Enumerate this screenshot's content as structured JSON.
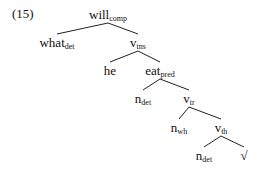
{
  "example_number": "(15)",
  "tree": {
    "nodes": [
      {
        "id": "will",
        "base": "will",
        "sub": "comp",
        "parent": null
      },
      {
        "id": "what",
        "base": "what",
        "sub": "det",
        "parent": "will"
      },
      {
        "id": "vtns",
        "base": "v",
        "sub": "tns",
        "parent": "will"
      },
      {
        "id": "he",
        "base": "he",
        "sub": "",
        "parent": "vtns"
      },
      {
        "id": "eat",
        "base": "eat",
        "sub": "pred",
        "parent": "vtns"
      },
      {
        "id": "ndet1",
        "base": "n",
        "sub": "det",
        "parent": "eat"
      },
      {
        "id": "vtr",
        "base": "v",
        "sub": "tr",
        "parent": "eat"
      },
      {
        "id": "nwh",
        "base": "n",
        "sub": "wh",
        "parent": "vtr"
      },
      {
        "id": "vth",
        "base": "v",
        "sub": "th",
        "parent": "vtr"
      },
      {
        "id": "ndet2",
        "base": "n",
        "sub": "det",
        "parent": "vth"
      },
      {
        "id": "root",
        "base": "√",
        "sub": "",
        "parent": "vth"
      }
    ]
  }
}
